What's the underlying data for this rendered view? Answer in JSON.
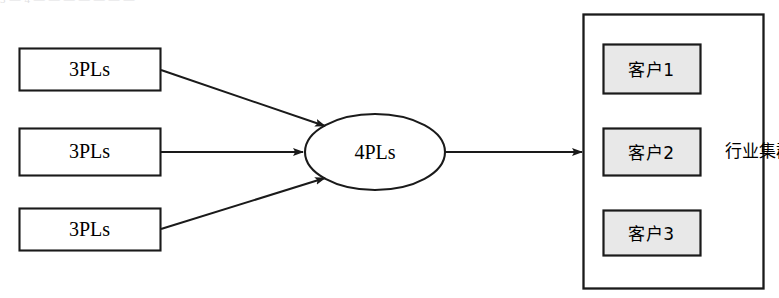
{
  "figure": {
    "width": 779,
    "height": 298,
    "background": "#ffffff",
    "top_artifact_text": "3 — 4 — — — — — — —"
  },
  "colors": {
    "stroke": "#1a1a1a",
    "node_fill_white": "#ffffff",
    "client_fill_gray": "#e8e8e8",
    "text": "#000000"
  },
  "providers": {
    "label_common": "3PLs",
    "items": [
      {
        "label": "3PLs",
        "x": 19,
        "y": 48,
        "w": 141,
        "h": 42
      },
      {
        "label": "3PLs",
        "x": 19,
        "y": 128,
        "w": 141,
        "h": 47
      },
      {
        "label": "3PLs",
        "x": 19,
        "y": 208,
        "w": 141,
        "h": 42
      }
    ]
  },
  "integrator": {
    "label": "4PLs",
    "cx": 375,
    "cy": 152,
    "rx": 70,
    "ry": 38
  },
  "cluster": {
    "vertical_label": "行业集群",
    "x": 583,
    "y": 14,
    "w": 180,
    "h": 274,
    "clients": [
      {
        "label": "客户1",
        "x": 603,
        "y": 44,
        "w": 97,
        "h": 49
      },
      {
        "label": "客户2",
        "x": 603,
        "y": 128,
        "w": 97,
        "h": 47
      },
      {
        "label": "客户3",
        "x": 603,
        "y": 210,
        "w": 97,
        "h": 45
      }
    ]
  },
  "connectors": [
    {
      "name": "3pls-1-to-4pls",
      "from": "provider-1",
      "to": "integrator",
      "style": "diagonal-down"
    },
    {
      "name": "3pls-2-to-4pls",
      "from": "provider-2",
      "to": "integrator",
      "style": "horizontal"
    },
    {
      "name": "3pls-3-to-4pls",
      "from": "provider-3",
      "to": "integrator",
      "style": "diagonal-up"
    },
    {
      "name": "4pls-to-cluster",
      "from": "integrator",
      "to": "cluster",
      "style": "horizontal"
    }
  ]
}
